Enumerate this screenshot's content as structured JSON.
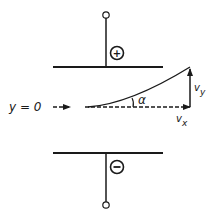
{
  "diagram": {
    "type": "deflection-of-charged-particle-between-plates",
    "colors": {
      "ink": "#1a1a1a",
      "background": "#ffffff"
    },
    "plates": {
      "top": {
        "polarity_symbol": "+",
        "label": "positive-plate"
      },
      "bottom": {
        "polarity_symbol": "−",
        "label": "negative-plate"
      }
    },
    "labels": {
      "axis": "y = 0",
      "angle": "α",
      "vy_main": "v",
      "vy_sub": "y",
      "vx_main": "v",
      "vx_sub": "x"
    }
  }
}
